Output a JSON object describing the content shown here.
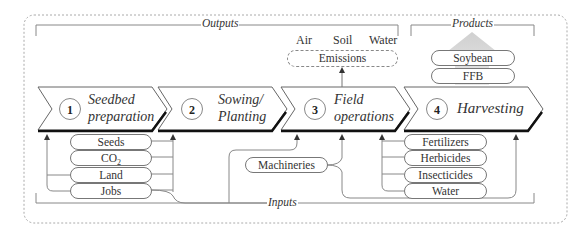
{
  "sections": {
    "outputs": "Outputs",
    "products": "Products",
    "inputs": "Inputs"
  },
  "emissions": {
    "label": "Emissions",
    "targets": [
      "Air",
      "Soil",
      "Water"
    ]
  },
  "products": [
    "Soybean",
    "FFB"
  ],
  "steps": [
    {
      "number": "1",
      "line1": "Seedbed",
      "line2": "preparation"
    },
    {
      "number": "2",
      "line1": "Sowing/",
      "line2": "Planting"
    },
    {
      "number": "3",
      "line1": "Field",
      "line2": "operations"
    },
    {
      "number": "4",
      "line1": "Harvesting",
      "line2": ""
    }
  ],
  "inputs_left": [
    "Seeds",
    "CO2",
    "Land",
    "Jobs"
  ],
  "inputs_left_co2": {
    "base": "CO",
    "sub": "2"
  },
  "inputs_middle": [
    "Machineries"
  ],
  "inputs_right": [
    "Fertilizers",
    "Herbicides",
    "Insecticides",
    "Water"
  ]
}
